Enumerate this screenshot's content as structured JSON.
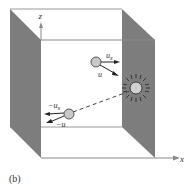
{
  "figure": {
    "caption": "(b)",
    "axes": {
      "z_label": "z",
      "x_label": "x"
    },
    "particles": {
      "upper": {
        "vx_label": "u",
        "vx_sub": "x",
        "v_label": "u"
      },
      "lower": {
        "vx_label": "−u",
        "vx_sub": "x",
        "v_label": "−u"
      }
    },
    "source": {
      "icon": "starburst-icon"
    },
    "colors": {
      "wall_fill": "#7d7d7d",
      "line": "#8a8a8a",
      "ball_fill": "#c8c8c8",
      "text": "#333333"
    }
  }
}
